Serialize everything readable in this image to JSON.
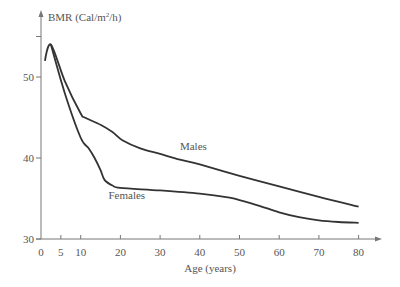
{
  "chart_data": {
    "type": "line",
    "title": "",
    "xlabel": "Age (years)",
    "ylabel": "BMR (Cal/m²/h)",
    "ylabel_parts": {
      "main": "BMR (Cal/m",
      "sup": "2",
      "tail": "/h)"
    },
    "xlim": [
      0,
      85
    ],
    "ylim": [
      30,
      57
    ],
    "x_ticks": [
      0,
      5,
      10,
      20,
      30,
      40,
      50,
      60,
      70,
      80
    ],
    "y_ticks": [
      30,
      40,
      50
    ],
    "y_minor_ticks": [
      55
    ],
    "grid": false,
    "legend": "inline labels",
    "series": [
      {
        "name": "Males",
        "label_position": {
          "x": 35,
          "y": 41
        },
        "x": [
          1,
          2.5,
          6,
          10,
          11,
          15,
          18,
          20.5,
          25,
          30,
          35,
          40,
          50,
          60,
          70,
          80
        ],
        "values": [
          52,
          54,
          49.5,
          45.5,
          45,
          44.1,
          43.2,
          42.2,
          41.2,
          40.5,
          39.8,
          39.2,
          37.8,
          36.5,
          35.2,
          34
        ]
      },
      {
        "name": "Females",
        "label_position": {
          "x": 17,
          "y": 35
        },
        "x": [
          2.5,
          6,
          10,
          12,
          13.5,
          15,
          16,
          18,
          20,
          30,
          40,
          47.5,
          50,
          55,
          60,
          65,
          70,
          75,
          80
        ],
        "values": [
          54,
          48,
          42.5,
          41.2,
          40,
          38.5,
          37.3,
          36.6,
          36.3,
          36,
          35.6,
          35.1,
          34.8,
          34.1,
          33.3,
          32.7,
          32.3,
          32.1,
          32
        ]
      }
    ]
  }
}
